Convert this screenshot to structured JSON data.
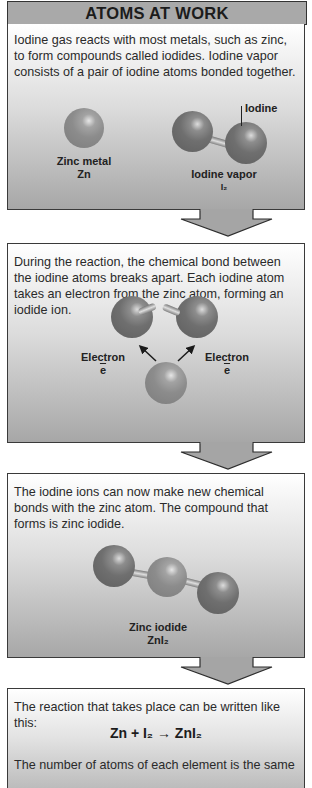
{
  "title": "ATOMS AT WORK",
  "colors": {
    "title_bar": "#a9a9a9",
    "panel_top": "#ffffff",
    "panel_bottom": "#a7a7a7",
    "zinc_atom": "#8c8c8c",
    "iodine_atom": "#6f6f6f",
    "border": "#3a3a3a"
  },
  "panels": [
    {
      "text": "Iodine gas reacts with most metals, such as zinc, to form compounds called iodides. Iodine vapor consists of a pair of iodine atoms bonded together.",
      "labels": {
        "zinc_name": "Zinc metal",
        "zinc_formula": "Zn",
        "iodine_pointer": "Iodine",
        "vapor_name": "Iodine vapor",
        "vapor_formula": "I₂"
      }
    },
    {
      "text": "During the reaction, the chemical bond between the iodine atoms breaks apart. Each iodine atom takes an electron from the zinc atom, forming an iodide ion.",
      "labels": {
        "electron_left": "Electron",
        "electron_left_symbol": "e",
        "electron_right": "Electron",
        "electron_right_symbol": "e"
      }
    },
    {
      "text": "The iodine ions can now make new chemical bonds with the zinc atom. The compound that forms is zinc iodide.",
      "labels": {
        "compound_name": "Zinc iodide",
        "compound_formula": "ZnI₂"
      }
    },
    {
      "text": "The reaction that takes place can be written like this:",
      "equation": "Zn + I₂ → ZnI₂",
      "text2": "The number of atoms of each element is the same"
    }
  ]
}
